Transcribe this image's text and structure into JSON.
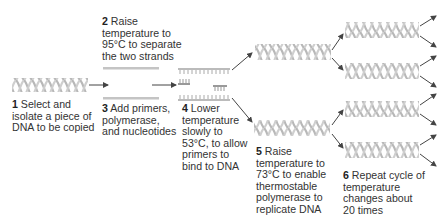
{
  "figure": {
    "steps": [
      {
        "num": "1",
        "text": "Select and\nisolate a piece of\nDNA to be copied"
      },
      {
        "num": "2",
        "text": "Raise\ntemperature to\n95°C to separate\nthe two strands"
      },
      {
        "num": "3",
        "text": "Add primers,\npolymerase,\nand nucleotides"
      },
      {
        "num": "4",
        "text": "Lower\ntemperature\nslowly to\n53°C, to allow\nprimers to\nbind to DNA"
      },
      {
        "num": "5",
        "text": "Raise\ntemperature to\n73°C to enable\nthermostable\npolymerase to\nreplicate DNA"
      },
      {
        "num": "6",
        "text": "Repeat cycle of\ntemperature\nchanges about\n20 times"
      }
    ],
    "colors": {
      "helix": "#bdbdbd",
      "strand": "#c4c4c4",
      "arrow": "#444444",
      "text": "#333333"
    }
  }
}
